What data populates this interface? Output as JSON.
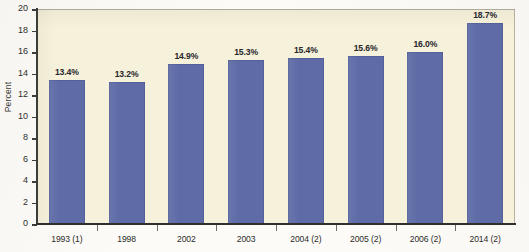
{
  "chart_data": {
    "type": "bar",
    "title": "",
    "xlabel": "",
    "ylabel": "Percent",
    "ylim": [
      0,
      20
    ],
    "ytick_step": 2,
    "yticks": [
      20,
      18,
      16,
      14,
      12,
      10,
      8,
      6,
      4,
      2,
      0
    ],
    "grid": false,
    "legend": "none",
    "categories": [
      "1993 (1)",
      "1998",
      "2002",
      "2003",
      "2004 (2)",
      "2005 (2)",
      "2006 (2)",
      "2014 (2)"
    ],
    "values": [
      13.4,
      13.2,
      14.9,
      15.3,
      15.4,
      15.6,
      16.0,
      18.7
    ],
    "data_labels": [
      "13.4%",
      "13.2%",
      "14.9%",
      "15.3%",
      "15.4%",
      "15.6%",
      "16.0%",
      "18.7%"
    ],
    "series": [
      {
        "name": "Percent",
        "values": [
          13.4,
          13.2,
          14.9,
          15.3,
          15.4,
          15.6,
          16.0,
          18.7
        ]
      }
    ]
  },
  "colors": {
    "bar": "#5e6ba6",
    "plot_background": "#f6f1da",
    "page_background": "#fcfbf7",
    "axis": "#3c3c3a",
    "text": "#2b2b29"
  }
}
